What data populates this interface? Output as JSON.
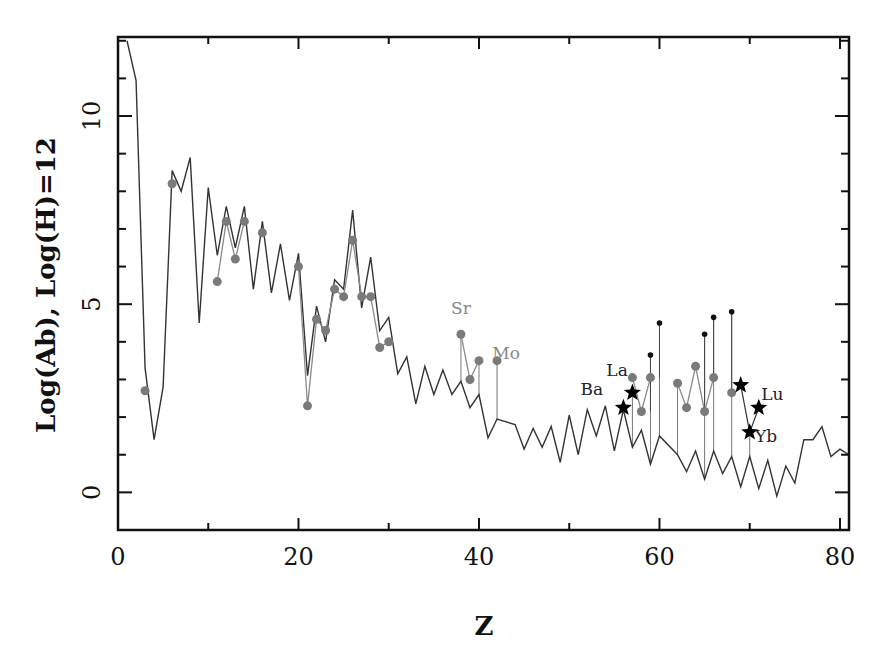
{
  "chart_data": {
    "type": "line",
    "title": "",
    "xlabel": "Z",
    "ylabel": "Log(Ab), Log(H)=12",
    "xlim": [
      0,
      81
    ],
    "ylim": [
      -1,
      12.1
    ],
    "xticks": [
      0,
      20,
      40,
      60,
      80
    ],
    "yticks": [
      0,
      5,
      10
    ],
    "grid": false,
    "legend": null,
    "colors": {
      "solar": "#333333",
      "observed": "#7a7a7a",
      "upper": "#111111",
      "star": "#000000"
    },
    "series": [
      {
        "name": "Solar abundance (scaled)",
        "style": "line",
        "points": [
          [
            1,
            12.0
          ],
          [
            2,
            10.95
          ],
          [
            3,
            3.3
          ],
          [
            4,
            1.4
          ],
          [
            5,
            2.8
          ],
          [
            6,
            8.55
          ],
          [
            7,
            8.0
          ],
          [
            8,
            8.9
          ],
          [
            9,
            4.5
          ],
          [
            10,
            8.1
          ],
          [
            11,
            6.3
          ],
          [
            12,
            7.6
          ],
          [
            13,
            6.5
          ],
          [
            14,
            7.6
          ],
          [
            15,
            5.4
          ],
          [
            16,
            7.2
          ],
          [
            17,
            5.3
          ],
          [
            18,
            6.6
          ],
          [
            19,
            5.1
          ],
          [
            20,
            6.35
          ],
          [
            21,
            3.1
          ],
          [
            22,
            4.95
          ],
          [
            23,
            4.0
          ],
          [
            24,
            5.65
          ],
          [
            25,
            5.4
          ],
          [
            26,
            7.5
          ],
          [
            27,
            4.9
          ],
          [
            28,
            6.25
          ],
          [
            29,
            4.3
          ],
          [
            30,
            4.65
          ],
          [
            31,
            3.15
          ],
          [
            32,
            3.6
          ],
          [
            33,
            2.35
          ],
          [
            34,
            3.35
          ],
          [
            35,
            2.6
          ],
          [
            36,
            3.25
          ],
          [
            37,
            2.6
          ],
          [
            38,
            2.95
          ],
          [
            39,
            2.25
          ],
          [
            40,
            2.6
          ],
          [
            41,
            1.45
          ],
          [
            42,
            1.95
          ],
          [
            44,
            1.8
          ],
          [
            45,
            1.15
          ],
          [
            46,
            1.7
          ],
          [
            47,
            1.2
          ],
          [
            48,
            1.75
          ],
          [
            49,
            0.8
          ],
          [
            50,
            2.05
          ],
          [
            51,
            1.0
          ],
          [
            52,
            2.2
          ],
          [
            53,
            1.5
          ],
          [
            54,
            2.3
          ],
          [
            55,
            1.1
          ],
          [
            56,
            2.2
          ],
          [
            57,
            1.2
          ],
          [
            58,
            1.65
          ],
          [
            59,
            0.75
          ],
          [
            60,
            1.5
          ],
          [
            62,
            1.0
          ],
          [
            63,
            0.55
          ],
          [
            64,
            1.1
          ],
          [
            65,
            0.35
          ],
          [
            66,
            1.1
          ],
          [
            67,
            0.5
          ],
          [
            68,
            0.95
          ],
          [
            69,
            0.15
          ],
          [
            70,
            0.95
          ],
          [
            71,
            0.1
          ],
          [
            72,
            0.85
          ],
          [
            73,
            -0.1
          ],
          [
            74,
            0.7
          ],
          [
            75,
            0.25
          ],
          [
            76,
            1.4
          ],
          [
            77,
            1.4
          ],
          [
            78,
            1.75
          ],
          [
            79,
            0.95
          ],
          [
            80,
            1.15
          ],
          [
            81,
            1.0
          ]
        ]
      },
      {
        "name": "Observed abundances",
        "style": "line+markers",
        "points": [
          [
            3,
            2.7
          ],
          [
            6,
            8.2
          ],
          [
            11,
            5.6
          ],
          [
            12,
            7.2
          ],
          [
            13,
            6.2
          ],
          [
            14,
            7.2
          ],
          [
            16,
            6.9
          ],
          [
            20,
            6.0
          ],
          [
            21,
            2.3
          ],
          [
            22,
            4.6
          ],
          [
            23,
            4.3
          ],
          [
            24,
            5.4
          ],
          [
            25,
            5.2
          ],
          [
            26,
            6.7
          ],
          [
            27,
            5.2
          ],
          [
            28,
            5.2
          ],
          [
            29,
            3.85
          ],
          [
            30,
            4.0
          ],
          [
            38,
            4.2
          ],
          [
            39,
            3.0
          ],
          [
            40,
            3.5
          ],
          [
            42,
            3.5
          ],
          [
            57,
            3.05
          ],
          [
            58,
            2.15
          ],
          [
            59,
            3.05
          ],
          [
            62,
            2.9
          ],
          [
            63,
            2.25
          ],
          [
            64,
            3.35
          ],
          [
            65,
            2.15
          ],
          [
            66,
            3.05
          ],
          [
            68,
            2.65
          ]
        ]
      },
      {
        "name": "Upper limits",
        "style": "markers-small",
        "points": [
          [
            59,
            3.65
          ],
          [
            60,
            4.5
          ],
          [
            65,
            4.2
          ],
          [
            66,
            4.65
          ],
          [
            68,
            4.8
          ]
        ]
      },
      {
        "name": "Star markers",
        "style": "stars",
        "points": [
          [
            56,
            2.25
          ],
          [
            57,
            2.65
          ],
          [
            69,
            2.85
          ],
          [
            70,
            1.6
          ],
          [
            71,
            2.25
          ]
        ]
      }
    ],
    "annotations": [
      {
        "text": "Sr",
        "x": 38,
        "y": 4.75,
        "color": "#888888"
      },
      {
        "text": "Mo",
        "x": 43,
        "y": 3.55,
        "color": "#888888"
      },
      {
        "text": "La",
        "x": 55.3,
        "y": 3.1,
        "color": "#222222"
      },
      {
        "text": "Ba",
        "x": 52.5,
        "y": 2.6,
        "color": "#222222"
      },
      {
        "text": "Lu",
        "x": 72.5,
        "y": 2.45,
        "color": "#222222"
      },
      {
        "text": "Yb",
        "x": 71.8,
        "y": 1.35,
        "color": "#222222"
      }
    ]
  }
}
